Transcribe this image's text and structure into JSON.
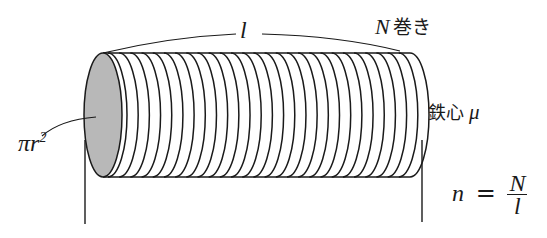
{
  "figure": {
    "labels": {
      "length": "l",
      "turns_var": "N",
      "turns_text": "巻き",
      "core_text": "鉄心",
      "core_var": "μ",
      "area": "πr",
      "area_exp": "2",
      "formula_lhs": "n",
      "formula_eq": "=",
      "formula_num": "N",
      "formula_den": "l"
    },
    "colors": {
      "line": "#1a1a1a",
      "end_face": "#b8b8b8",
      "background": "#ffffff"
    },
    "coil_count": 28
  }
}
